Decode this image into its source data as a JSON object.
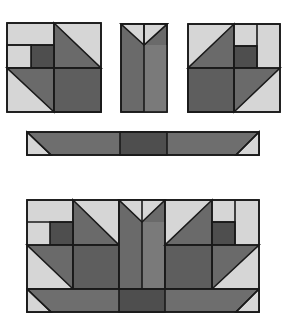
{
  "colors": {
    "light": "#d6d6d6",
    "medium": "#6f6f6f",
    "dark": "#585858",
    "darkest": "#4b4b4b",
    "outline": "#1a1a1a",
    "background": "#ffffff"
  },
  "pieces": {
    "left_unit": "left-basket-unit",
    "center_unit": "center-stem-unit",
    "right_unit": "right-basket-unit",
    "base_strip": "base-strip",
    "assembled_block": "assembled-block"
  }
}
